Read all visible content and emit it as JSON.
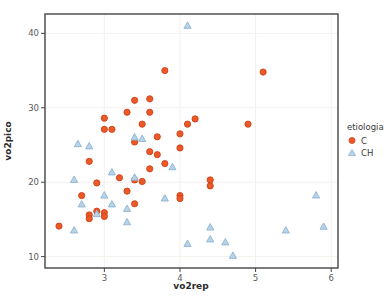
{
  "figure": {
    "width": 391,
    "height": 307,
    "background": "#ffffff",
    "panel": {
      "left": 45,
      "top": 14,
      "right": 338,
      "bottom": 268,
      "border_color": "#454545",
      "grid_color": "#f4f1ee"
    }
  },
  "chart_data": {
    "type": "scatter",
    "title": "",
    "xlabel": "vo2rep",
    "ylabel": "vo2pico",
    "xlim": [
      2.215,
      6.09
    ],
    "ylim": [
      8.47,
      42.6
    ],
    "xticks": [
      3,
      4,
      5,
      6
    ],
    "yticks": [
      10,
      20,
      30,
      40
    ],
    "grid": "faint major gridlines",
    "legend_title": "etiologia",
    "legend_position": "right",
    "series": [
      {
        "name": "C",
        "marker": "circle",
        "color": "#ea5a28",
        "edge_color": "#d03f17",
        "points": [
          [
            2.4,
            14.1
          ],
          [
            2.7,
            18.2
          ],
          [
            2.8,
            22.8
          ],
          [
            2.8,
            15.6
          ],
          [
            2.8,
            15.1
          ],
          [
            2.9,
            19.9
          ],
          [
            2.9,
            16.1
          ],
          [
            3.0,
            28.6
          ],
          [
            3.0,
            27.1
          ],
          [
            3.1,
            27.1
          ],
          [
            3.0,
            15.9
          ],
          [
            3.0,
            15.4
          ],
          [
            3.2,
            20.6
          ],
          [
            3.3,
            29.4
          ],
          [
            3.3,
            18.8
          ],
          [
            3.4,
            31.0
          ],
          [
            3.4,
            25.4
          ],
          [
            3.4,
            20.3
          ],
          [
            3.4,
            17.1
          ],
          [
            3.5,
            27.8
          ],
          [
            3.5,
            20.1
          ],
          [
            3.6,
            31.2
          ],
          [
            3.6,
            29.4
          ],
          [
            3.6,
            24.1
          ],
          [
            3.6,
            21.8
          ],
          [
            3.7,
            26.1
          ],
          [
            3.7,
            23.7
          ],
          [
            3.8,
            35.0
          ],
          [
            3.8,
            22.5
          ],
          [
            4.0,
            26.5
          ],
          [
            4.0,
            24.6
          ],
          [
            4.0,
            18.2
          ],
          [
            4.0,
            17.8
          ],
          [
            4.1,
            27.8
          ],
          [
            4.2,
            28.5
          ],
          [
            4.4,
            20.3
          ],
          [
            4.4,
            19.5
          ],
          [
            4.9,
            27.8
          ],
          [
            5.1,
            34.8
          ]
        ]
      },
      {
        "name": "CH",
        "marker": "triangle",
        "color": "#b7d3e8",
        "edge_color": "#8fb3d2",
        "points": [
          [
            2.6,
            20.3
          ],
          [
            2.6,
            13.5
          ],
          [
            2.65,
            25.1
          ],
          [
            2.7,
            17.0
          ],
          [
            2.8,
            24.8
          ],
          [
            2.9,
            15.7
          ],
          [
            3.0,
            18.2
          ],
          [
            3.1,
            21.3
          ],
          [
            3.1,
            17.0
          ],
          [
            3.3,
            16.4
          ],
          [
            3.3,
            14.6
          ],
          [
            3.4,
            26.0
          ],
          [
            3.4,
            20.6
          ],
          [
            3.5,
            25.8
          ],
          [
            3.8,
            17.8
          ],
          [
            3.9,
            22.0
          ],
          [
            4.1,
            41.0
          ],
          [
            4.1,
            11.7
          ],
          [
            4.4,
            13.9
          ],
          [
            4.4,
            12.3
          ],
          [
            4.6,
            11.9
          ],
          [
            4.7,
            10.1
          ],
          [
            5.4,
            13.5
          ],
          [
            5.8,
            18.2
          ],
          [
            5.9,
            14.0
          ]
        ]
      }
    ]
  }
}
